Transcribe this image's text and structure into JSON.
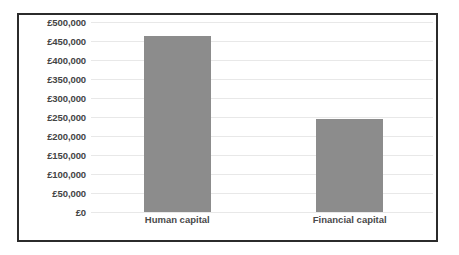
{
  "chart_data": {
    "type": "bar",
    "title": "",
    "subtitle": "",
    "xlabel": "",
    "ylabel": "",
    "categories": [
      "Human capital",
      "Financial capital"
    ],
    "values": [
      463000,
      245000
    ],
    "value_labels": [
      "",
      ""
    ],
    "ylim": [
      0,
      500000
    ],
    "ytick_values": [
      500000,
      450000,
      400000,
      350000,
      300000,
      250000,
      200000,
      150000,
      100000,
      50000,
      0
    ],
    "ytick_labels": [
      "£500,000",
      "£450,000",
      "£400,000",
      "£350,000",
      "£300,000",
      "£250,000",
      "£200,000",
      "£150,000",
      "£100,000",
      "£50,000",
      "£0"
    ],
    "grid": true,
    "grid_axis": "y",
    "legend": false,
    "legend_position": "none",
    "series": [
      {
        "name": "Capital value",
        "values": [
          463000,
          245000
        ],
        "color": "#8c8c8c"
      }
    ],
    "annotations": []
  },
  "style": {
    "bar_color": "#8c8c8c",
    "gridline_color": "#e8e8e8",
    "frame_color": "#2b2b2b",
    "tick_label_color": "#444444",
    "category_label_color": "#4a4a4a",
    "plot_background": "#ffffff",
    "page_background": "#ffffff"
  }
}
